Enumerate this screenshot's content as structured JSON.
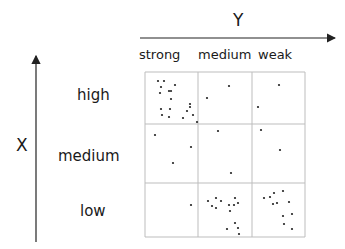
{
  "diagram": {
    "y_axis_title": "Y",
    "x_axis_title": "X",
    "columns": [
      {
        "label": "strong"
      },
      {
        "label": "medium"
      },
      {
        "label": "weak"
      }
    ],
    "rows": [
      {
        "label": "high"
      },
      {
        "label": "medium"
      },
      {
        "label": "low"
      }
    ],
    "grid": {
      "left": 145,
      "top": 72,
      "col_edges": [
        145,
        198,
        252,
        305
      ],
      "row_edges": [
        72,
        124,
        183,
        237
      ]
    },
    "dots": [
      [
        158,
        81
      ],
      [
        164,
        81
      ],
      [
        161,
        87
      ],
      [
        175,
        85
      ],
      [
        169,
        91
      ],
      [
        171,
        91
      ],
      [
        160,
        93
      ],
      [
        171,
        99
      ],
      [
        190,
        104
      ],
      [
        190,
        107
      ],
      [
        161,
        109
      ],
      [
        170,
        109
      ],
      [
        187,
        111
      ],
      [
        162,
        115
      ],
      [
        169,
        117
      ],
      [
        183,
        118
      ],
      [
        193,
        115
      ],
      [
        197,
        122
      ],
      [
        229,
        86
      ],
      [
        207,
        98
      ],
      [
        279,
        85
      ],
      [
        258,
        107
      ],
      [
        155,
        135
      ],
      [
        191,
        147
      ],
      [
        173,
        163
      ],
      [
        218,
        131
      ],
      [
        231,
        173
      ],
      [
        261,
        130
      ],
      [
        280,
        150
      ],
      [
        191,
        205
      ],
      [
        208,
        201
      ],
      [
        216,
        198
      ],
      [
        212,
        206
      ],
      [
        216,
        208
      ],
      [
        221,
        201
      ],
      [
        235,
        198
      ],
      [
        229,
        205
      ],
      [
        234,
        205
      ],
      [
        230,
        211
      ],
      [
        238,
        203
      ],
      [
        227,
        229
      ],
      [
        235,
        223
      ],
      [
        239,
        234
      ],
      [
        238,
        228
      ],
      [
        264,
        198
      ],
      [
        270,
        197
      ],
      [
        273,
        204
      ],
      [
        277,
        203
      ],
      [
        289,
        202
      ],
      [
        274,
        193
      ],
      [
        283,
        191
      ],
      [
        283,
        216
      ],
      [
        284,
        224
      ],
      [
        292,
        214
      ],
      [
        292,
        229
      ]
    ]
  }
}
